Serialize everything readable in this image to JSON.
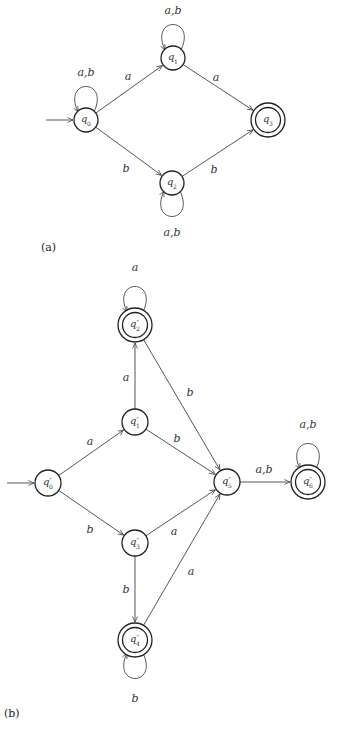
{
  "diagrams": [
    {
      "caption": "(a)",
      "caption_pos": [
        41,
        251
      ],
      "start_state": "q0",
      "states": [
        {
          "id": "q0",
          "label": "q",
          "sub": "0",
          "x": 86,
          "y": 120,
          "r": 12,
          "accepting": false
        },
        {
          "id": "q1",
          "label": "q",
          "sub": "1",
          "x": 173,
          "y": 58,
          "r": 12,
          "accepting": false
        },
        {
          "id": "q2",
          "label": "q",
          "sub": "2",
          "x": 172,
          "y": 183,
          "r": 12,
          "accepting": false
        },
        {
          "id": "q3",
          "label": "q",
          "sub": "3",
          "x": 268,
          "y": 120,
          "r": 17,
          "accepting": true
        }
      ],
      "transitions": [
        {
          "from": "q0",
          "to": "q0",
          "label": "a,b",
          "loop": "up",
          "lx": 86,
          "ly": 76
        },
        {
          "from": "q0",
          "to": "q1",
          "label": "a",
          "lx": 128,
          "ly": 80
        },
        {
          "from": "q0",
          "to": "q2",
          "label": "b",
          "lx": 126,
          "ly": 172
        },
        {
          "from": "q1",
          "to": "q1",
          "label": "a,b",
          "loop": "up",
          "lx": 173,
          "ly": 14
        },
        {
          "from": "q1",
          "to": "q3",
          "label": "a",
          "lx": 216,
          "ly": 81
        },
        {
          "from": "q2",
          "to": "q2",
          "label": "a,b",
          "loop": "down",
          "lx": 172,
          "ly": 236
        },
        {
          "from": "q2",
          "to": "q3",
          "label": "b",
          "lx": 214,
          "ly": 173
        }
      ]
    },
    {
      "caption": "(b)",
      "caption_pos": [
        4,
        717
      ],
      "start_state": "q0p",
      "states": [
        {
          "id": "q0p",
          "label": "q′",
          "sub": "0",
          "x": 48,
          "y": 483,
          "r": 13,
          "accepting": false
        },
        {
          "id": "q1p",
          "label": "q′",
          "sub": "1",
          "x": 135,
          "y": 422,
          "r": 13,
          "accepting": false
        },
        {
          "id": "q2p",
          "label": "q′",
          "sub": "2",
          "x": 135,
          "y": 325,
          "r": 17,
          "accepting": true
        },
        {
          "id": "q3p",
          "label": "q′",
          "sub": "3",
          "x": 135,
          "y": 543,
          "r": 13,
          "accepting": false
        },
        {
          "id": "q4p",
          "label": "q′",
          "sub": "4",
          "x": 135,
          "y": 640,
          "r": 17,
          "accepting": true
        },
        {
          "id": "q5p",
          "label": "q′",
          "sub": "5",
          "x": 227,
          "y": 482,
          "r": 13,
          "accepting": false
        },
        {
          "id": "q6p",
          "label": "q′",
          "sub": "6",
          "x": 308,
          "y": 482,
          "r": 17,
          "accepting": true
        }
      ],
      "transitions": [
        {
          "from": "q0p",
          "to": "q1p",
          "label": "a",
          "lx": 90,
          "ly": 445
        },
        {
          "from": "q0p",
          "to": "q3p",
          "label": "b",
          "lx": 90,
          "ly": 533
        },
        {
          "from": "q1p",
          "to": "q2p",
          "label": "a",
          "lx": 126,
          "ly": 381
        },
        {
          "from": "q1p",
          "to": "q5p",
          "label": "b",
          "lx": 177,
          "ly": 442
        },
        {
          "from": "q2p",
          "to": "q2p",
          "label": "a",
          "loop": "up",
          "lx": 135,
          "ly": 271
        },
        {
          "from": "q2p",
          "to": "q5p",
          "label": "b",
          "lx": 190,
          "ly": 396
        },
        {
          "from": "q3p",
          "to": "q4p",
          "label": "b",
          "lx": 126,
          "ly": 593
        },
        {
          "from": "q3p",
          "to": "q5p",
          "label": "a",
          "lx": 174,
          "ly": 535
        },
        {
          "from": "q4p",
          "to": "q4p",
          "label": "b",
          "loop": "down",
          "lx": 135,
          "ly": 702
        },
        {
          "from": "q4p",
          "to": "q5p",
          "label": "a",
          "lx": 191,
          "ly": 575
        },
        {
          "from": "q5p",
          "to": "q6p",
          "label": "a,b",
          "lx": 264,
          "ly": 473
        },
        {
          "from": "q6p",
          "to": "q6p",
          "label": "a,b",
          "loop": "up",
          "lx": 308,
          "ly": 428
        }
      ]
    }
  ],
  "colors": {
    "stroke": "#222222",
    "edge": "#444444",
    "background": "#ffffff"
  }
}
